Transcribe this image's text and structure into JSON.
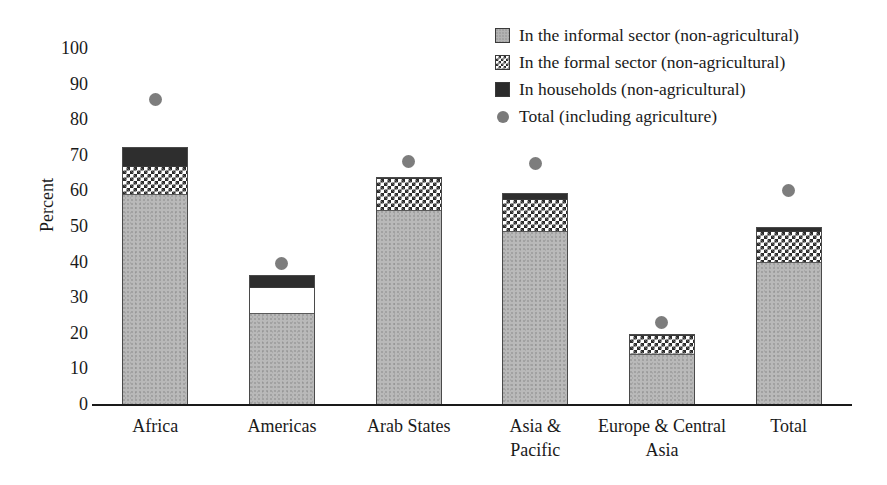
{
  "chart_data": {
    "type": "bar",
    "subtype": "stacked-bar-with-overlay-points",
    "title": "",
    "xlabel": "",
    "ylabel": "Percent",
    "ylim": [
      0,
      100
    ],
    "yticks": [
      100,
      90,
      80,
      70,
      60,
      50,
      40,
      30,
      20,
      10,
      0
    ],
    "grid": false,
    "legend_position": "top-right",
    "categories": [
      "Africa",
      "Americas",
      "Arab States",
      "Asia & Pacific",
      "Europe & Central Asia",
      "Total"
    ],
    "series": [
      {
        "name": "In the informal sector (non-agricultural)",
        "type": "bar-segment",
        "color": "#b9b9b9",
        "pattern": "stipple",
        "values": [
          59,
          25.5,
          54.5,
          48.5,
          14,
          40
        ]
      },
      {
        "name": "In the formal sector (non-agricultural)",
        "type": "bar-segment",
        "color": "#ffffff",
        "pattern": "checkerboard",
        "values": [
          8,
          7.5,
          9,
          9,
          5.5,
          8.5
        ]
      },
      {
        "name": "In households (non-agricultural)",
        "type": "bar-segment",
        "color": "#2e2e2e",
        "pattern": "solid",
        "values": [
          5,
          3,
          0,
          1.5,
          0,
          1
        ]
      },
      {
        "name": "Total (including agriculture)",
        "type": "scatter-point",
        "color": "#7d7d7d",
        "values": [
          85.5,
          39.5,
          68,
          67.5,
          23,
          60
        ]
      }
    ],
    "stack_totals": [
      72,
      36,
      63.5,
      59,
      19.5,
      49.5
    ]
  },
  "legend": {
    "items": [
      {
        "label": "In the informal sector (non-agricultural)",
        "marker": "swatch-informal"
      },
      {
        "label": "In the formal sector (non-agricultural)",
        "marker": "swatch-formal"
      },
      {
        "label": "In households (non-agricultural)",
        "marker": "swatch-households"
      },
      {
        "label": "Total (including agriculture)",
        "marker": "dot-total"
      }
    ]
  },
  "axes": {
    "y_title": "Percent",
    "y_ticks": [
      "100",
      "90",
      "80",
      "70",
      "60",
      "50",
      "40",
      "30",
      "20",
      "10",
      "0"
    ],
    "x_labels": [
      "Africa",
      "Americas",
      "Arab States",
      "Asia &\nPacific",
      "Europe & Central\nAsia",
      "Total"
    ],
    "x_labels_line1": [
      "Africa",
      "Americas",
      "Arab States",
      "Asia &",
      "Europe & Central",
      "Total"
    ],
    "x_labels_line2": [
      "",
      "",
      "",
      "Pacific",
      "Asia",
      ""
    ]
  },
  "colors": {
    "informal": "#b9b9b9",
    "formal": "#ffffff",
    "households": "#2e2e2e",
    "total_dot": "#7d7d7d",
    "axis": "#1a1a1a",
    "background": "#ffffff"
  }
}
